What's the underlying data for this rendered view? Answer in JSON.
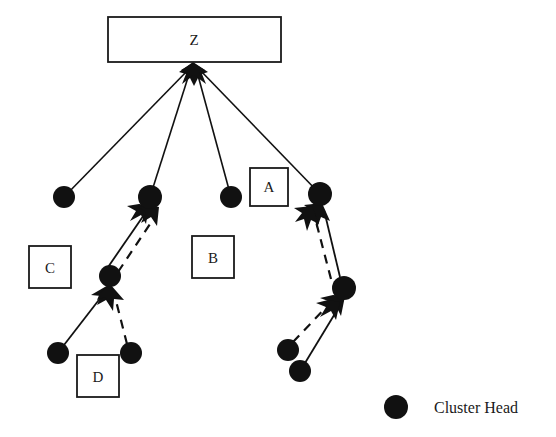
{
  "diagram": {
    "type": "network-topology",
    "background_color": "#ffffff",
    "stroke_color": "#111111",
    "node_color": "#111111",
    "boxes": [
      {
        "id": "Z",
        "label": "Z",
        "x": 108,
        "y": 17,
        "w": 173,
        "h": 45
      },
      {
        "id": "A",
        "label": "A",
        "x": 250,
        "y": 168,
        "w": 38,
        "h": 38
      },
      {
        "id": "B",
        "label": "B",
        "x": 192,
        "y": 236,
        "w": 42,
        "h": 42
      },
      {
        "id": "C",
        "label": "C",
        "x": 29,
        "y": 246,
        "w": 42,
        "h": 42
      },
      {
        "id": "D",
        "label": "D",
        "x": 77,
        "y": 355,
        "w": 42,
        "h": 42
      }
    ],
    "nodes": [
      {
        "id": "n1",
        "cx": 64,
        "cy": 197,
        "r": 11
      },
      {
        "id": "n2",
        "cx": 150,
        "cy": 197,
        "r": 12
      },
      {
        "id": "n3",
        "cx": 231,
        "cy": 197,
        "r": 11
      },
      {
        "id": "n4",
        "cx": 320,
        "cy": 194,
        "r": 12
      },
      {
        "id": "n5",
        "cx": 110,
        "cy": 276,
        "r": 11
      },
      {
        "id": "n6",
        "cx": 344,
        "cy": 288,
        "r": 12
      },
      {
        "id": "n7",
        "cx": 58,
        "cy": 353,
        "r": 11
      },
      {
        "id": "n8",
        "cx": 131,
        "cy": 353,
        "r": 11
      },
      {
        "id": "n9",
        "cx": 288,
        "cy": 350,
        "r": 11
      },
      {
        "id": "n10",
        "cx": 300,
        "cy": 371,
        "r": 11
      }
    ],
    "uplinks_to_z": [
      {
        "from": "n1",
        "to_x": 193,
        "to_y": 66
      },
      {
        "from": "n2",
        "to_x": 193,
        "to_y": 66
      },
      {
        "from": "n3",
        "to_x": 193,
        "to_y": 66
      },
      {
        "from": "n4",
        "to_x": 193,
        "to_y": 66
      }
    ],
    "solid_links": [
      {
        "from": "n5",
        "to": "n2"
      },
      {
        "from": "n7",
        "to": "n5"
      },
      {
        "from": "n6",
        "to": "n4"
      },
      {
        "from": "n10",
        "to": "n6"
      }
    ],
    "dashed_links": [
      {
        "from": "n5",
        "to": "n2"
      },
      {
        "from": "n8",
        "to": "n5"
      },
      {
        "from": "n6",
        "to": "n4"
      },
      {
        "from": "n9",
        "to": "n6"
      }
    ]
  },
  "legend": {
    "marker_cx": 396,
    "marker_cy": 407,
    "marker_r": 12,
    "label": "Cluster Head",
    "label_x": 434,
    "label_y": 413
  }
}
